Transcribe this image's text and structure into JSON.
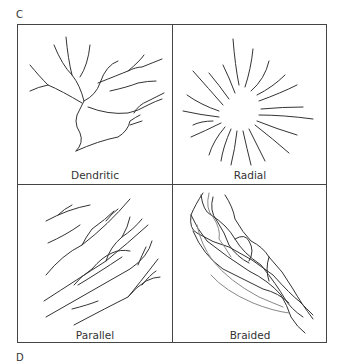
{
  "figure": {
    "panel_labels": {
      "top": "C",
      "bottom": "D"
    },
    "cells": [
      {
        "id": "dendritic",
        "caption": "Dendritic"
      },
      {
        "id": "radial",
        "caption": "Radial"
      },
      {
        "id": "parallel",
        "caption": "Parallel"
      },
      {
        "id": "braided",
        "caption": "Braided"
      }
    ]
  }
}
